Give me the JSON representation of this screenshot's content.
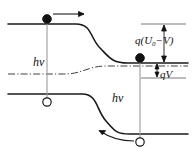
{
  "figure": {
    "colors": {
      "band": "#1a1a1a",
      "fermi": "#2a2a2a",
      "transition": "#9a9a9a",
      "measure": "#1a1a1a",
      "background": "#ffffff"
    },
    "labels": {
      "photon_left": "hν",
      "photon_right": "hν",
      "barrier": "q(U",
      "barrier_sub": "0",
      "barrier_tail": "−V)",
      "bias": "qV"
    },
    "carriers": [
      {
        "name": "electron-top-left",
        "type": "electron",
        "x": 47,
        "y": 22
      },
      {
        "name": "hole-bottom-left",
        "type": "hole",
        "x": 47,
        "y": 100
      },
      {
        "name": "electron-mid-right",
        "type": "electron",
        "x": 140,
        "y": 61
      },
      {
        "name": "hole-bottom-right",
        "type": "hole",
        "x": 140,
        "y": 140
      }
    ],
    "arrows": [
      {
        "name": "electron-drift-arrow",
        "direction": "right"
      },
      {
        "name": "hole-drift-arrow",
        "direction": "left"
      }
    ],
    "band_geometry": {
      "conduction_left_level": 24,
      "conduction_right_level": 63,
      "valence_left_level": 94,
      "valence_right_level": 134,
      "fermi_left_level": 74,
      "fermi_right_level": 66,
      "transition_start_x": 76,
      "transition_end_x": 124
    },
    "measures": [
      {
        "name": "barrier-measure",
        "label": "q(U0−V)",
        "top": 24,
        "bottom": 63
      },
      {
        "name": "bias-measure",
        "label": "qV",
        "top": 63,
        "bottom": 78
      }
    ]
  }
}
